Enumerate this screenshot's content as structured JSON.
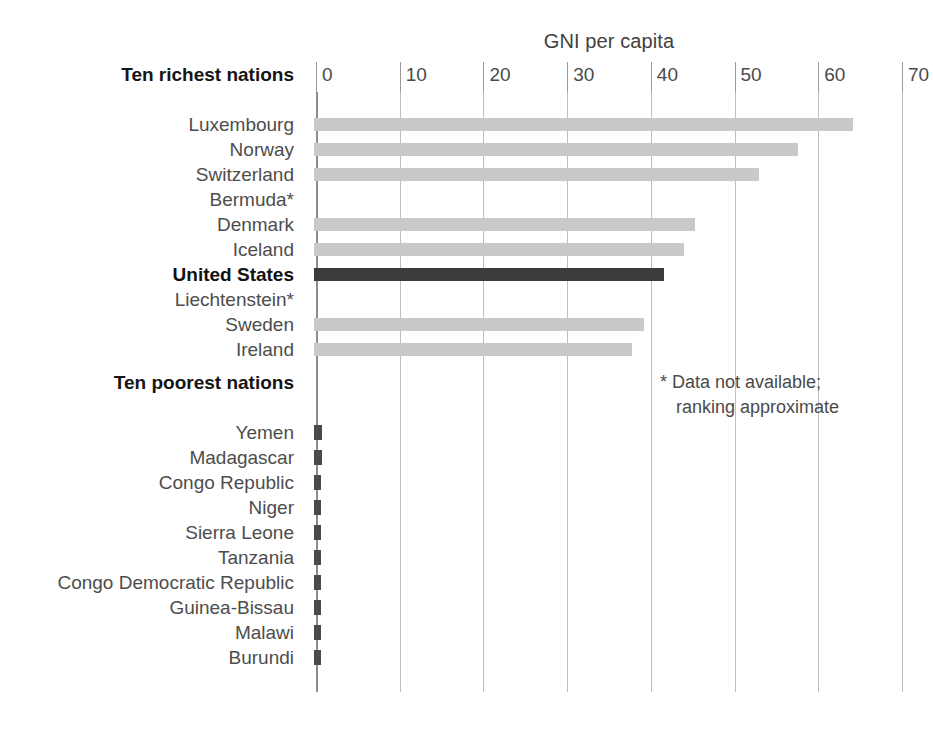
{
  "chart_data": {
    "type": "bar",
    "title": "GNI per capita",
    "xlabel": "",
    "ylabel": "",
    "orientation": "horizontal",
    "xlim": [
      0,
      70
    ],
    "xticks": [
      0,
      10,
      20,
      30,
      40,
      50,
      60,
      70
    ],
    "xtick_labels": [
      "0",
      "10",
      "20",
      "30",
      "40",
      "50",
      "60",
      "70"
    ],
    "grid": true,
    "legend": "none",
    "sections": [
      {
        "heading": "Ten richest nations",
        "categories": [
          "Luxembourg",
          "Norway",
          "Switzerland",
          "Bermuda*",
          "Denmark",
          "Iceland",
          "United States",
          "Liechtenstein*",
          "Sweden",
          "Ireland"
        ],
        "values": [
          64.4,
          57.8,
          53.2,
          null,
          45.5,
          44.2,
          41.8,
          null,
          39.4,
          38.0
        ],
        "highlight": "United States",
        "no_data": [
          "Bermuda*",
          "Liechtenstein*"
        ]
      },
      {
        "heading": "Ten poorest nations",
        "categories": [
          "Yemen",
          "Madagascar",
          "Congo Republic",
          "Niger",
          "Sierra Leone",
          "Tanzania",
          "Congo Democratic Republic",
          "Guinea-Bissau",
          "Malawi",
          "Burundi"
        ],
        "values": [
          0.95,
          0.9,
          0.85,
          0.8,
          0.77,
          0.73,
          0.7,
          0.65,
          0.6,
          0.55
        ],
        "highlight": "",
        "no_data": []
      }
    ],
    "annotations": [
      "* Data not available;",
      "ranking approximate"
    ],
    "colors": {
      "bar": "#c9c9c9",
      "bar_highlight": "#3b3b3b",
      "bar_small": "#4a4a4a",
      "gridline": "#bfbfbf",
      "axis": "#8d8d8d",
      "text": "#4d4d4d",
      "text_bold": "#111111",
      "background": "#ffffff"
    }
  },
  "footnote": {
    "line1": "* Data not available;",
    "line2": "ranking approximate"
  }
}
